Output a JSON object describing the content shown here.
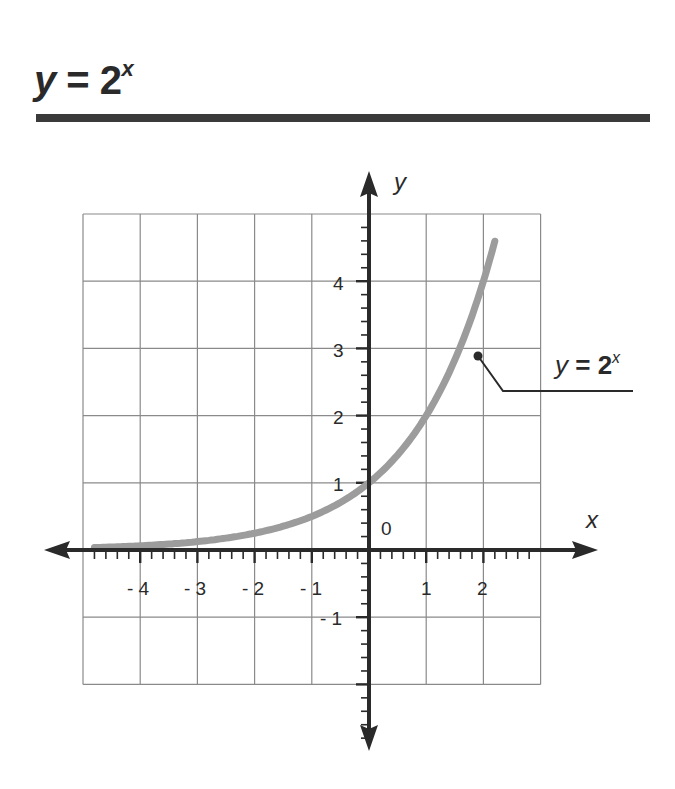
{
  "header": {
    "title_var": "y",
    "title_eq": " = 2",
    "title_exp": "x"
  },
  "colors": {
    "rule": "#3a3a3a",
    "grid": "#8a8a8a",
    "axis": "#2a2a2a",
    "curve": "#9c9c9c",
    "text": "#2a2a2a"
  },
  "axes": {
    "x_label": "x",
    "y_label": "y",
    "origin_label": "0",
    "x_tick_labels": [
      "- 4",
      "- 3",
      "- 2",
      "- 1",
      "1",
      "2"
    ],
    "y_tick_labels": [
      "4",
      "3",
      "2",
      "1",
      "- 1"
    ]
  },
  "callout": {
    "var": "y",
    "eq": " = 2",
    "exp": "x"
  },
  "chart_data": {
    "type": "line",
    "xlabel": "x",
    "ylabel": "y",
    "xlim": [
      -5,
      3
    ],
    "ylim": [
      -2,
      5
    ],
    "grid": true,
    "x_ticks": [
      -4,
      -3,
      -2,
      -1,
      1,
      2
    ],
    "y_ticks": [
      -1,
      1,
      2,
      3,
      4
    ],
    "minor_ticks_per_unit": 5,
    "series": [
      {
        "name": "y = 2^x",
        "function": "2^x",
        "x": [
          -4.8,
          -4,
          -3,
          -2,
          -1,
          0,
          1,
          1.5,
          2,
          2.22
        ],
        "y": [
          0.036,
          0.0625,
          0.125,
          0.25,
          0.5,
          1,
          2,
          2.83,
          4,
          4.66
        ]
      }
    ],
    "annotations": [
      {
        "text": "y = 2^x",
        "point": [
          1.9,
          2.9
        ],
        "position": "right"
      }
    ]
  }
}
